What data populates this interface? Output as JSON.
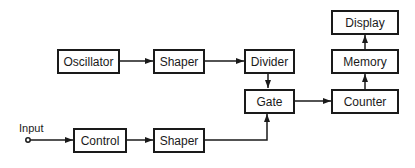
{
  "diagram": {
    "type": "block-diagram",
    "blocks": {
      "oscillator": "Oscillator",
      "shaper_top": "Shaper",
      "divider": "Divider",
      "gate": "Gate",
      "display": "Display",
      "memory": "Memory",
      "counter": "Counter",
      "control": "Control",
      "shaper_bottom": "Shaper"
    },
    "input_label": "Input",
    "connections": [
      {
        "from": "Oscillator",
        "to": "Shaper (top)"
      },
      {
        "from": "Shaper (top)",
        "to": "Divider"
      },
      {
        "from": "Divider",
        "to": "Gate"
      },
      {
        "from": "Gate",
        "to": "Counter"
      },
      {
        "from": "Counter",
        "to": "Memory"
      },
      {
        "from": "Memory",
        "to": "Display"
      },
      {
        "from": "Input",
        "to": "Control"
      },
      {
        "from": "Control",
        "to": "Shaper (bottom)"
      },
      {
        "from": "Shaper (bottom)",
        "to": "Gate"
      }
    ],
    "colors": {
      "stroke": "#1a1a1a",
      "background": "#ffffff"
    }
  }
}
